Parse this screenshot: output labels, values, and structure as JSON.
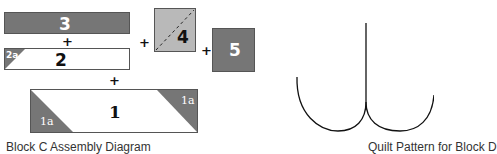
{
  "colors": {
    "dark_fill": "#767676",
    "light_fill": "#b9b9b9",
    "white_fill": "#ffffff",
    "border": "#555555",
    "label_light": "#ffffff",
    "label_dark": "#111111"
  },
  "assembly_diagram": {
    "pieces": {
      "p3": {
        "label": "3"
      },
      "p2": {
        "label": "2",
        "corner_label": "2a"
      },
      "p1": {
        "label": "1",
        "corner_left_label": "1a",
        "corner_right_label": "1a"
      },
      "p4": {
        "label": "4"
      },
      "p5": {
        "label": "5"
      }
    },
    "operators": {
      "plus_3_2": "+",
      "plus_2_1": "+",
      "plus_rows_4": "+",
      "plus_4_5": "+"
    },
    "caption": "Block C Assembly Diagram"
  },
  "quilt_pattern": {
    "caption": "Quilt Pattern for Block D"
  }
}
